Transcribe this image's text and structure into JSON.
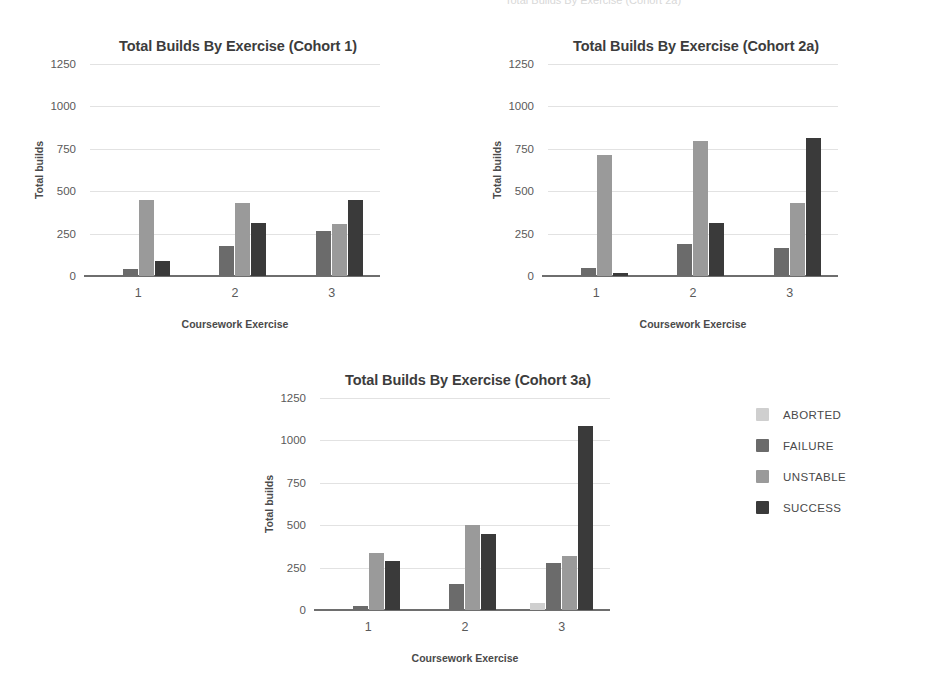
{
  "page": {
    "background_color": "#ffffff",
    "top_edge_artifact": "Total Builds By Exercise (Cohort 2a)"
  },
  "series_colors": {
    "ABORTED": "#cfcfcf",
    "FAILURE": "#6b6b6b",
    "UNSTABLE": "#9a9a9a",
    "SUCCESS": "#3a3a3a"
  },
  "legend": {
    "position": "right",
    "items": [
      {
        "label": "ABORTED",
        "color": "#cfcfcf"
      },
      {
        "label": "FAILURE",
        "color": "#6b6b6b"
      },
      {
        "label": "UNSTABLE",
        "color": "#9a9a9a"
      },
      {
        "label": "SUCCESS",
        "color": "#3a3a3a"
      }
    ]
  },
  "axis": {
    "yticks": [
      0,
      250,
      500,
      750,
      1000,
      1250
    ],
    "ytick_labels": [
      "0",
      "250",
      "500",
      "750",
      "1000",
      "1250"
    ],
    "ylim": [
      0,
      1250
    ],
    "xtick_labels": [
      "1",
      "2",
      "3"
    ],
    "ylabel": "Total builds",
    "xlabel": "Coursework Exercise",
    "grid": true
  },
  "chart_data": [
    {
      "type": "bar",
      "title": "Total Builds By Exercise (Cohort 1)",
      "xlabel": "Coursework Exercise",
      "ylabel": "Total builds",
      "ylim": [
        0,
        1250
      ],
      "yticks": [
        0,
        250,
        500,
        750,
        1000,
        1250
      ],
      "categories": [
        "1",
        "2",
        "3"
      ],
      "grid": true,
      "legend": "right",
      "series": [
        {
          "name": "ABORTED",
          "color": "#cfcfcf",
          "values": [
            0,
            0,
            0
          ]
        },
        {
          "name": "FAILURE",
          "color": "#6b6b6b",
          "values": [
            40,
            175,
            265
          ]
        },
        {
          "name": "UNSTABLE",
          "color": "#9a9a9a",
          "values": [
            450,
            430,
            305
          ]
        },
        {
          "name": "SUCCESS",
          "color": "#3a3a3a",
          "values": [
            90,
            315,
            450
          ]
        }
      ]
    },
    {
      "type": "bar",
      "title": "Total Builds By Exercise (Cohort 2a)",
      "xlabel": "Coursework Exercise",
      "ylabel": "Total builds",
      "ylim": [
        0,
        1250
      ],
      "yticks": [
        0,
        250,
        500,
        750,
        1000,
        1250
      ],
      "categories": [
        "1",
        "2",
        "3"
      ],
      "grid": true,
      "legend": "right",
      "series": [
        {
          "name": "ABORTED",
          "color": "#cfcfcf",
          "values": [
            0,
            0,
            0
          ]
        },
        {
          "name": "FAILURE",
          "color": "#6b6b6b",
          "values": [
            50,
            190,
            165
          ]
        },
        {
          "name": "UNSTABLE",
          "color": "#9a9a9a",
          "values": [
            715,
            795,
            430
          ]
        },
        {
          "name": "SUCCESS",
          "color": "#3a3a3a",
          "values": [
            20,
            315,
            815
          ]
        }
      ]
    },
    {
      "type": "bar",
      "title": "Total Builds By Exercise (Cohort 3a)",
      "xlabel": "Coursework Exercise",
      "ylabel": "Total builds",
      "ylim": [
        0,
        1250
      ],
      "yticks": [
        0,
        250,
        500,
        750,
        1000,
        1250
      ],
      "categories": [
        "1",
        "2",
        "3"
      ],
      "grid": true,
      "legend": "right",
      "series": [
        {
          "name": "ABORTED",
          "color": "#cfcfcf",
          "values": [
            0,
            0,
            40
          ]
        },
        {
          "name": "FAILURE",
          "color": "#6b6b6b",
          "values": [
            25,
            155,
            280
          ]
        },
        {
          "name": "UNSTABLE",
          "color": "#9a9a9a",
          "values": [
            335,
            500,
            320
          ]
        },
        {
          "name": "SUCCESS",
          "color": "#3a3a3a",
          "values": [
            290,
            450,
            1085
          ]
        }
      ]
    }
  ]
}
